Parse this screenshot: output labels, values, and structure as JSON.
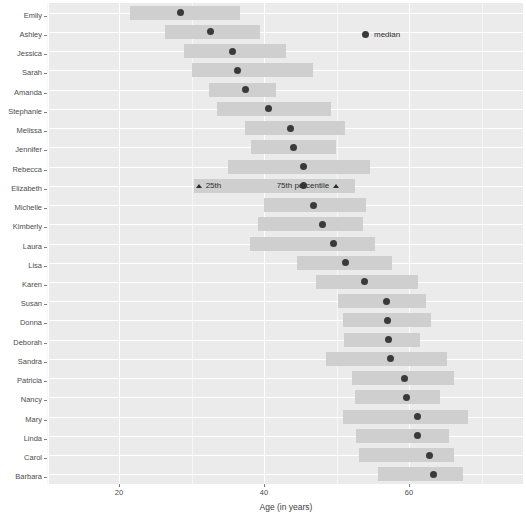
{
  "chart_data": {
    "type": "bar",
    "orientation": "horizontal",
    "title": "",
    "xlabel": "Age (in years)",
    "ylabel": "",
    "xlim": [
      12,
      74
    ],
    "xticks": [
      20,
      40,
      60
    ],
    "xtick_labels": [
      "20",
      "40",
      "60"
    ],
    "grid": true,
    "legend": {
      "position": "top-right",
      "entries": [
        {
          "name": "median",
          "marker": "dot",
          "color": "#3a3a3a"
        }
      ]
    },
    "annotations": [
      {
        "text": "25th",
        "marker": "triangle",
        "marker_side": "left",
        "row": "Elizabeth",
        "age": 30.3
      },
      {
        "text": "75th percentile",
        "marker": "triangle",
        "marker_side": "right",
        "row": "Elizabeth",
        "age": 52.5
      }
    ],
    "bar_color": "#cfcfcf",
    "categories": [
      "Emily",
      "Ashley",
      "Jessica",
      "Sarah",
      "Amanda",
      "Stephanie",
      "Melissa",
      "Jennifer",
      "Rebecca",
      "Elizabeth",
      "Michelle",
      "Kimberly",
      "Laura",
      "Lisa",
      "Karen",
      "Susan",
      "Donna",
      "Deborah",
      "Sandra",
      "Patricia",
      "Nancy",
      "Mary",
      "Linda",
      "Carol",
      "Barbara"
    ],
    "series": [
      {
        "name": "p25",
        "values": [
          21.5,
          26.3,
          29.0,
          30.0,
          32.4,
          33.5,
          37.4,
          38.2,
          35.0,
          30.3,
          40.0,
          39.2,
          38.0,
          44.6,
          47.2,
          50.2,
          50.9,
          51.0,
          48.6,
          52.2,
          52.5,
          50.9,
          52.7,
          53.1,
          55.7
        ]
      },
      {
        "name": "median",
        "values": [
          28.5,
          32.6,
          35.7,
          36.4,
          37.5,
          40.6,
          43.6,
          44.0,
          45.4,
          45.5,
          46.8,
          48.1,
          49.6,
          51.2,
          53.9,
          56.9,
          57.1,
          57.2,
          57.5,
          59.4,
          59.6,
          61.2,
          61.2,
          62.8,
          63.4
        ]
      },
      {
        "name": "p75",
        "values": [
          36.7,
          39.5,
          43.1,
          46.7,
          41.6,
          49.2,
          51.2,
          50.0,
          54.6,
          52.5,
          54.1,
          53.6,
          55.3,
          57.6,
          61.3,
          62.4,
          63.0,
          61.5,
          65.3,
          66.2,
          64.3,
          68.2,
          65.5,
          66.2,
          67.5
        ]
      }
    ]
  },
  "axis": {
    "x_title": "Age (in years)"
  },
  "legend": {
    "median_label": "median"
  },
  "annotations": {
    "p25_label": "25th",
    "p75_label": "75th percentile"
  }
}
